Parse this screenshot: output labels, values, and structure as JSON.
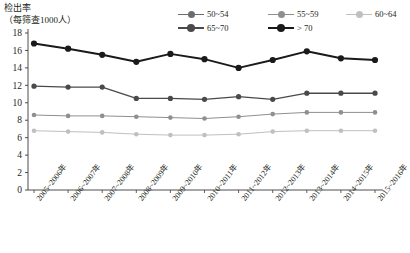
{
  "chart_data": {
    "type": "line",
    "title": "",
    "ylabel_line1": "检出率",
    "ylabel_line2": "（每筛查1000人）",
    "xlabel": "",
    "ylim": [
      0,
      18
    ],
    "yticks": [
      18,
      16,
      14,
      12,
      10,
      8,
      6,
      4,
      2,
      0
    ],
    "grid": false,
    "legend_position": "top",
    "categories": [
      "2005~2006年",
      "2006~2007年",
      "2007~2008年",
      "2008~2009年",
      "2009~2010年",
      "2010~2011年",
      "2011~2012年",
      "2012~2013年",
      "2013~2014年",
      "2014~2015年",
      "2015~2016年"
    ],
    "series": [
      {
        "name": "50~54",
        "color": "#6d6d6d",
        "values": [
          null,
          null,
          null,
          null,
          null,
          null,
          null,
          null,
          null,
          null,
          null
        ]
      },
      {
        "name": "55~59",
        "color": "#8f8f8f",
        "values": [
          8.6,
          8.5,
          8.5,
          8.4,
          8.3,
          8.2,
          8.4,
          8.7,
          8.9,
          8.9,
          8.9
        ]
      },
      {
        "name": "60~64",
        "color": "#c0c0c0",
        "values": [
          6.8,
          6.7,
          6.6,
          6.4,
          6.3,
          6.3,
          6.4,
          6.7,
          6.8,
          6.8,
          6.8
        ]
      },
      {
        "name": "65~70",
        "color": "#4a4a4a",
        "values": [
          11.9,
          11.8,
          11.8,
          10.5,
          10.5,
          10.4,
          10.7,
          10.4,
          11.1,
          11.1,
          11.1
        ]
      },
      {
        "name": "> 70",
        "color": "#1a1a1a",
        "values": [
          16.8,
          16.2,
          15.5,
          14.7,
          15.6,
          15.0,
          14.0,
          14.9,
          15.9,
          15.1,
          14.9
        ]
      }
    ]
  },
  "legend": {
    "items": [
      {
        "label": "50~54"
      },
      {
        "label": "55~59"
      },
      {
        "label": "60~64"
      },
      {
        "label": "65~70"
      },
      {
        "label": "> 70"
      }
    ]
  },
  "axis": {
    "y_title_1": "检出率",
    "y_title_2": "（每筛查1000人）",
    "y_tick_labels": [
      "18",
      "16",
      "14",
      "12",
      "10",
      "8",
      "6",
      "4",
      "2",
      "0"
    ]
  }
}
